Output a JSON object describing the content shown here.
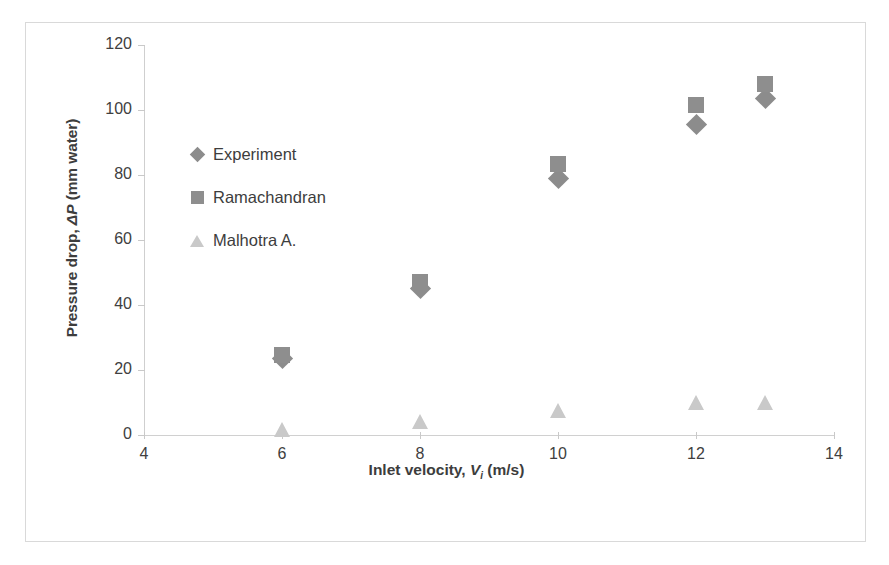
{
  "chart_data": {
    "type": "scatter",
    "title": "",
    "xlabel": "Inlet velocity, Vi (m/s)",
    "ylabel": "Pressure drop, ΔP (mm water)",
    "xlim": [
      4,
      14
    ],
    "ylim": [
      0,
      120
    ],
    "xticks": [
      4,
      6,
      8,
      10,
      12,
      14
    ],
    "yticks": [
      0,
      20,
      40,
      60,
      80,
      100,
      120
    ],
    "grid": false,
    "legend_position": "inside-upper-left",
    "x": [
      6,
      8,
      10,
      12,
      13
    ],
    "series": [
      {
        "name": "Experiment",
        "marker": "diamond",
        "color": "#8c8c8c",
        "values": [
          23.5,
          45.0,
          79.0,
          95.5,
          103.5
        ]
      },
      {
        "name": "Ramachandran",
        "marker": "square",
        "color": "#8e8e8e",
        "values": [
          24.5,
          47.0,
          83.5,
          101.5,
          108.0
        ]
      },
      {
        "name": "Malhotra A.",
        "marker": "triangle",
        "color": "#c9c9c9",
        "values": [
          1.5,
          4.0,
          7.5,
          10.0,
          10.0
        ]
      }
    ]
  },
  "axes": {
    "y_title_prefix": "Pressure drop, ",
    "y_title_symbol": "ΔP",
    "y_title_suffix": " (mm water)",
    "x_title_prefix": "Inlet velocity, ",
    "x_title_symbol": "V",
    "x_title_sub": "i",
    "x_title_suffix": " (m/s)",
    "y_tick_labels": [
      "120",
      "100",
      "80",
      "60",
      "40",
      "20",
      "0"
    ],
    "x_tick_labels": [
      "4",
      "6",
      "8",
      "10",
      "12",
      "14"
    ]
  },
  "legend": {
    "items": [
      {
        "label": "Experiment",
        "marker": "diamond-marker-icon"
      },
      {
        "label": "Ramachandran",
        "marker": "square-marker-icon"
      },
      {
        "label": "Malhotra A.",
        "marker": "triangle-marker-icon"
      }
    ]
  },
  "colors": {
    "experiment": "#8c8c8c",
    "ramachandran": "#8e8e8e",
    "malhotra": "#c9c9c9",
    "axis": "#cfcfcf",
    "frame_border": "#d9d9d9",
    "text": "#3d3d3d"
  }
}
